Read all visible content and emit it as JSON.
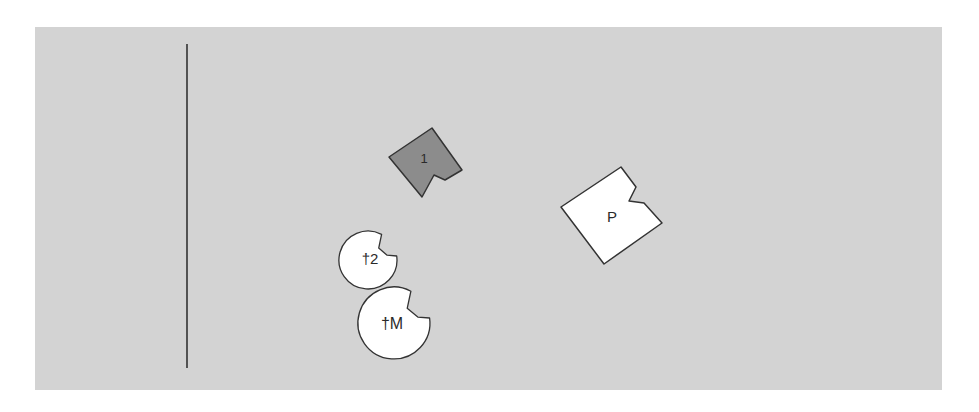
{
  "diagram": {
    "background_color": "#d3d3d3",
    "divider": {
      "x": 187,
      "y1": 44,
      "y2": 368,
      "color": "#333333"
    },
    "shapes": [
      {
        "id": "shape-1",
        "kind": "notched-square",
        "label": "1",
        "fill": "#8c8c8c",
        "points": "389,157 432,128 462,170 445,180 434,175 422,197",
        "label_pos": [
          424,
          163
        ],
        "font_size": 13
      },
      {
        "id": "shape-P",
        "kind": "notched-square",
        "label": "P",
        "fill": "#ffffff",
        "points": "561,207 621,167 636,187 629,201 644,203 662,223 604,264",
        "label_pos": [
          612,
          222
        ],
        "font_size": 15
      },
      {
        "id": "shape-dagger-2",
        "kind": "notched-circle",
        "label": "†2",
        "fill": "#ffffff",
        "cx": 368,
        "cy": 260,
        "r": 29,
        "label_pos": [
          370,
          264
        ],
        "font_size": 15
      },
      {
        "id": "shape-dagger-M",
        "kind": "notched-circle",
        "label": "†M",
        "fill": "#ffffff",
        "cx": 394,
        "cy": 323,
        "r": 36,
        "label_pos": [
          392,
          329
        ],
        "font_size": 16
      }
    ]
  }
}
